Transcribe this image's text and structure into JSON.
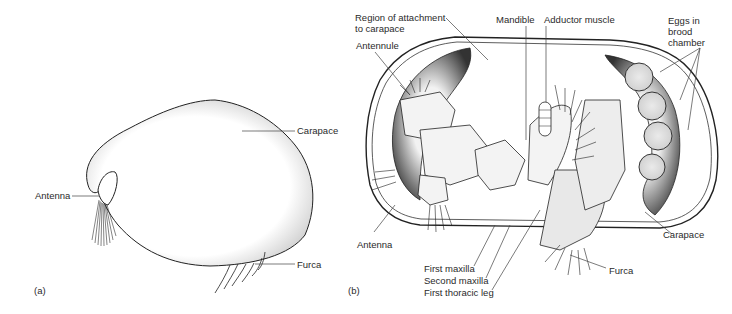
{
  "figure": {
    "panel_a": {
      "tag": "(a)",
      "labels": {
        "carapace": "Carapace",
        "antenna": "Antenna",
        "furca": "Furca"
      }
    },
    "panel_b": {
      "tag": "(b)",
      "labels": {
        "region_line1": "Region of attachment",
        "region_line2": "to carapace",
        "antennule": "Antennule",
        "mandible": "Mandible",
        "adductor": "Adductor muscle",
        "eggs_line1": "Eggs in",
        "eggs_line2": "brood",
        "eggs_line3": "chamber",
        "antenna": "Antenna",
        "first_maxilla": "First maxilla",
        "second_maxilla": "Second maxilla",
        "first_thoracic_leg": "First thoracic leg",
        "carapace": "Carapace",
        "furca": "Furca"
      }
    }
  }
}
